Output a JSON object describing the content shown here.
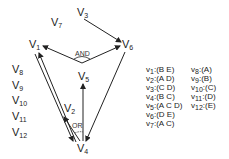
{
  "diagram": {
    "nodes": [
      {
        "id": "v1",
        "label": "V",
        "sub": "1",
        "x": 29,
        "y": 39
      },
      {
        "id": "v2",
        "label": "V",
        "sub": "2",
        "x": 64,
        "y": 103
      },
      {
        "id": "v3",
        "label": "V",
        "sub": "3",
        "x": 77,
        "y": 7
      },
      {
        "id": "v4",
        "label": "V",
        "sub": "4",
        "x": 76,
        "y": 142
      },
      {
        "id": "v5",
        "label": "V",
        "sub": "5",
        "x": 78,
        "y": 70
      },
      {
        "id": "v6",
        "label": "V",
        "sub": "6",
        "x": 121,
        "y": 38
      },
      {
        "id": "v7",
        "label": "V",
        "sub": "7",
        "x": 50,
        "y": 16
      },
      {
        "id": "v8",
        "label": "V",
        "sub": "8",
        "x": 12,
        "y": 64
      },
      {
        "id": "v9",
        "label": "V",
        "sub": "9",
        "x": 12,
        "y": 80
      },
      {
        "id": "v10",
        "label": "V",
        "sub": "10",
        "x": 12,
        "y": 95
      },
      {
        "id": "v11",
        "label": "V",
        "sub": "11",
        "x": 12,
        "y": 111
      },
      {
        "id": "v12",
        "label": "V",
        "sub": "12",
        "x": 12,
        "y": 127
      }
    ],
    "gates": [
      {
        "id": "and",
        "label": "AND",
        "x": 74,
        "y": 50
      },
      {
        "id": "or",
        "label": "OR",
        "x": 71,
        "y": 122
      }
    ],
    "edges": [
      {
        "from": "v3",
        "to": "v6"
      },
      {
        "from": "v5",
        "to": "v1",
        "gate": "and"
      },
      {
        "from": "v5",
        "to": "v6",
        "gate": "and"
      },
      {
        "from": "v4",
        "to": "v5",
        "gate": "or"
      },
      {
        "from": "v4",
        "to": "v2",
        "gate": "or"
      },
      {
        "from": "v4",
        "to": "v1"
      },
      {
        "from": "v1",
        "to": "v4"
      },
      {
        "from": "v6",
        "to": "v4"
      }
    ],
    "color": "#222222"
  },
  "legend": {
    "left": [
      {
        "v": "v",
        "sub": "1",
        "text": ":(B E)"
      },
      {
        "v": "v",
        "sub": "2",
        "text": ":(A D)"
      },
      {
        "v": "v",
        "sub": "3",
        "text": ":(C D)"
      },
      {
        "v": "v",
        "sub": "4",
        "text": ":(B C)"
      },
      {
        "v": "v",
        "sub": "5",
        "text": ":(A C D)"
      },
      {
        "v": "v",
        "sub": "6",
        "text": ":(D E)"
      },
      {
        "v": "v",
        "sub": "7",
        "text": ":(A C)"
      }
    ],
    "right": [
      {
        "v": "v",
        "sub": "8",
        "text": ":(A)"
      },
      {
        "v": "v",
        "sub": "9",
        "text": ":(B)"
      },
      {
        "v": "v",
        "sub": "10",
        "text": ":(C)"
      },
      {
        "v": "v",
        "sub": "11",
        "text": ":(D)"
      },
      {
        "v": "v",
        "sub": "12",
        "text": ":(E)"
      }
    ]
  }
}
